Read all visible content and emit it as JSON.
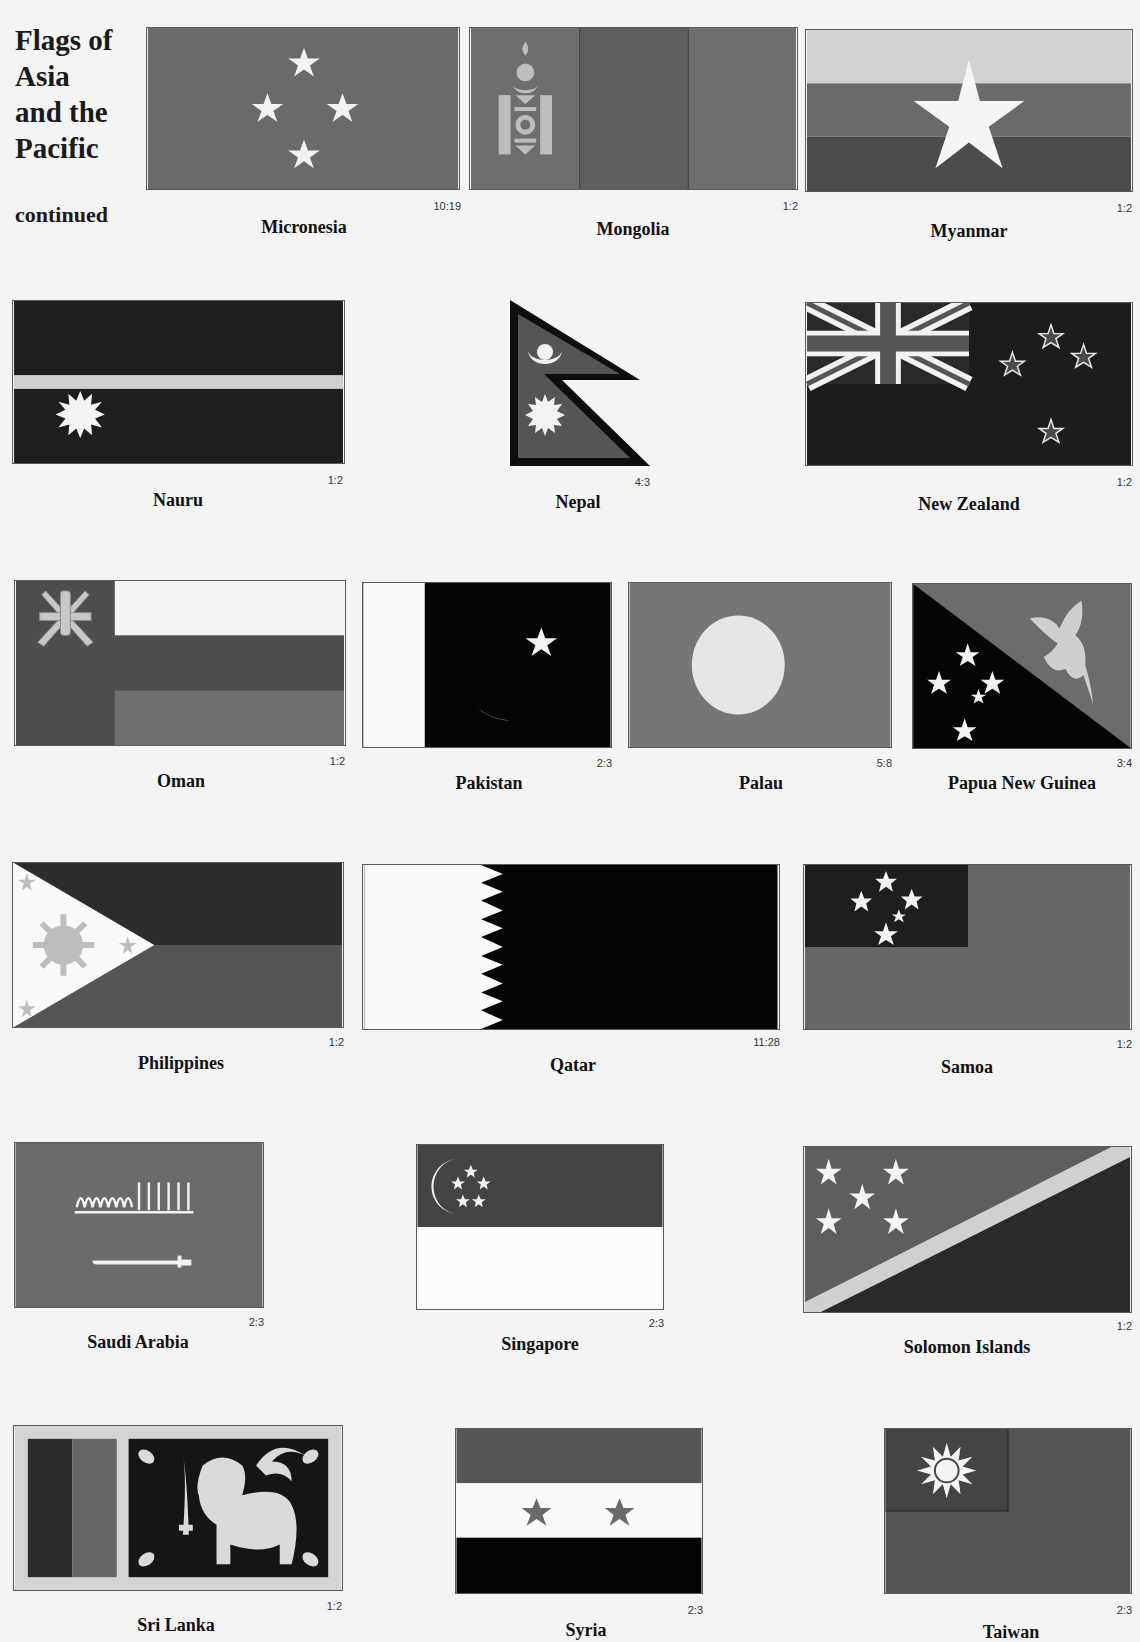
{
  "page": {
    "title_lines": [
      "Flags of",
      "Asia",
      "and the",
      "Pacific"
    ],
    "continued_label": "continued"
  },
  "colors": {
    "page_bg": "#f4f4f4",
    "mid_gray": "#6b6b6b",
    "dark_gray": "#3c3c3c",
    "light_gray": "#cfcfcf",
    "black": "#050505",
    "white": "#fafafa"
  },
  "flags": [
    {
      "name": "Micronesia",
      "ratio": "10:19"
    },
    {
      "name": "Mongolia",
      "ratio": "1:2"
    },
    {
      "name": "Myanmar",
      "ratio": "1:2"
    },
    {
      "name": "Nauru",
      "ratio": "1:2"
    },
    {
      "name": "Nepal",
      "ratio": "4:3"
    },
    {
      "name": "New Zealand",
      "ratio": "1:2"
    },
    {
      "name": "Oman",
      "ratio": "1:2"
    },
    {
      "name": "Pakistan",
      "ratio": "2:3"
    },
    {
      "name": "Palau",
      "ratio": "5:8"
    },
    {
      "name": "Papua New Guinea",
      "ratio": "3:4"
    },
    {
      "name": "Philippines",
      "ratio": "1:2"
    },
    {
      "name": "Qatar",
      "ratio": "11:28"
    },
    {
      "name": "Samoa",
      "ratio": "1:2"
    },
    {
      "name": "Saudi Arabia",
      "ratio": "2:3"
    },
    {
      "name": "Singapore",
      "ratio": "2:3"
    },
    {
      "name": "Solomon Islands",
      "ratio": "1:2"
    },
    {
      "name": "Sri Lanka",
      "ratio": "1:2"
    },
    {
      "name": "Syria",
      "ratio": "2:3"
    },
    {
      "name": "Taiwan",
      "ratio": "2:3"
    }
  ]
}
